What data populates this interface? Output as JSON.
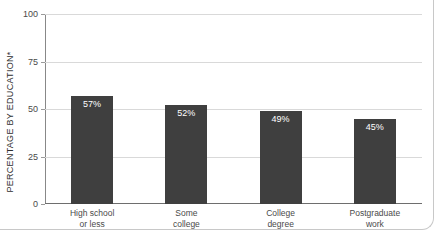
{
  "chart_data": {
    "type": "bar",
    "title": "",
    "subtitle": "",
    "xlabel": "",
    "ylabel": "PERCENTAGE BY EDUCATION*",
    "ylim": [
      0,
      100
    ],
    "yticks": [
      0,
      25,
      50,
      75,
      100
    ],
    "ytick_labels": [
      "0",
      "25",
      "50",
      "75",
      "100"
    ],
    "grid": true,
    "legend": false,
    "categories": [
      "High school\nor less",
      "Some\ncollege",
      "College\ndegree",
      "Postgraduate\nwork"
    ],
    "category_lines": [
      [
        "High school",
        "or less"
      ],
      [
        "Some",
        "college"
      ],
      [
        "College",
        "degree"
      ],
      [
        "Postgraduate",
        "work"
      ]
    ],
    "values": [
      57,
      52,
      49,
      45
    ],
    "value_labels": [
      "57%",
      "52%",
      "49%",
      "45%"
    ],
    "bar_color": "#3f3f3f",
    "value_label_color": "#ffffff",
    "gridline_color": "#d9d9d9",
    "axis_color": "#6e6e6e",
    "background_color": "#ffffff"
  }
}
